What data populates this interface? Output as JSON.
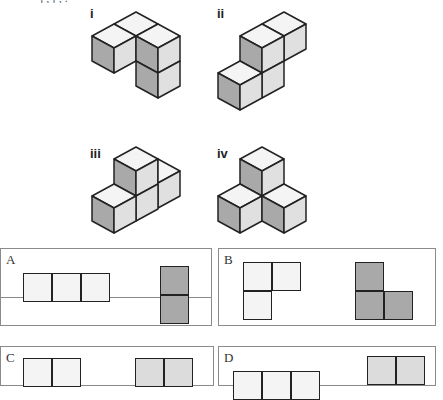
{
  "header": {
    "clipped_text": "ȷ   ,   ȷ      ,                                                  ."
  },
  "figures": [
    {
      "id": "i",
      "label": "i"
    },
    {
      "id": "ii",
      "label": "ii"
    },
    {
      "id": "iii",
      "label": "iii"
    },
    {
      "id": "iv",
      "label": "iv"
    }
  ],
  "options": [
    {
      "label": "A",
      "front_view": "3 squares in a row",
      "side_view": "2 squares stacked vertically"
    },
    {
      "label": "B",
      "front_view": "L-shape: 2 on top, 1 below left",
      "side_view": "L-shape: 1 on top left, 2 below"
    },
    {
      "label": "C",
      "front_view": "2 squares in a row",
      "side_view": "2 squares in a row"
    },
    {
      "label": "D",
      "front_view": "3 squares in a row",
      "side_view": "2 squares in a row"
    }
  ],
  "colors": {
    "top": "#f4f4f4",
    "left": "#a9a9a9",
    "right": "#e0e0e0",
    "stroke": "#222222",
    "panel_border": "#8a8a8a"
  }
}
